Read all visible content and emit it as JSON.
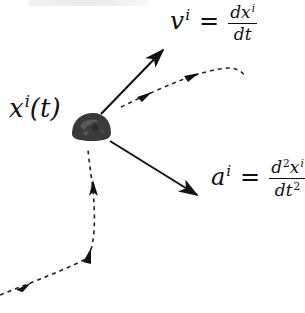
{
  "diagram": {
    "colors": {
      "background": "#ffffff",
      "ink": "#111111",
      "particle": "#3a3a3a"
    },
    "labels": {
      "position": {
        "base": "x",
        "sup": "i",
        "arg": "(t)"
      },
      "velocity": {
        "lhs_base": "v",
        "lhs_sup": "i",
        "eq": "=",
        "num_d": "d",
        "num_base": "x",
        "num_sup": "i",
        "den": "dt"
      },
      "acceleration": {
        "lhs_base": "a",
        "lhs_sup": "i",
        "eq": "=",
        "num_d": "d",
        "num_d_sup": "2",
        "num_base": "x",
        "num_sup": "i",
        "den_base": "dt",
        "den_sup": "2"
      }
    },
    "elements": {
      "particle": {
        "name": "particle-body",
        "cx": 92,
        "cy": 128
      },
      "velocity_vector": {
        "from": [
          101,
          114
        ],
        "to": [
          163,
          50
        ]
      },
      "acceleration_vector": {
        "from": [
          110,
          141
        ],
        "to": [
          197,
          195
        ]
      },
      "future_path": {
        "style": "dashed",
        "arrows": 2
      },
      "past_path": {
        "style": "dashed",
        "arrows": 3
      }
    }
  }
}
